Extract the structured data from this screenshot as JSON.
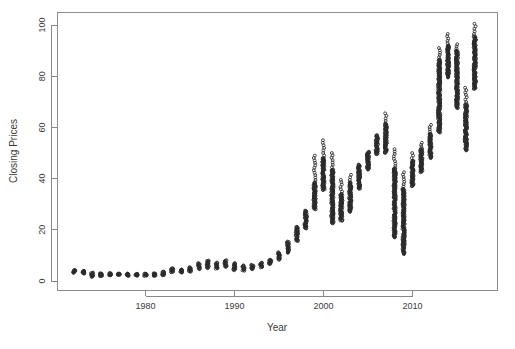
{
  "chart_data": {
    "type": "scatter",
    "title": "",
    "xlabel": "Year",
    "ylabel": "Closing Prices",
    "xlim": [
      1971.2,
      2018.6
    ],
    "ylim": [
      -1.5,
      103.5
    ],
    "grid": false,
    "legend": "none",
    "marker": "open-circle",
    "marker_color": "#2b2b2b",
    "xticks": [
      1980,
      1990,
      2000,
      2010
    ],
    "xtick_labels": [
      "1980",
      "1990",
      "2000",
      "2010"
    ],
    "yticks": [
      0,
      20,
      40,
      60,
      80,
      100
    ],
    "ytick_labels": [
      "0",
      "20",
      "40",
      "60",
      "80",
      "100"
    ],
    "series": [
      {
        "name": "Closing Prices",
        "x": [
          1972,
          1973,
          1974,
          1975,
          1976,
          1977,
          1978,
          1979,
          1980,
          1981,
          1982,
          1983,
          1984,
          1985,
          1986,
          1987,
          1988,
          1989,
          1990,
          1991,
          1992,
          1993,
          1994,
          1995,
          1996,
          1997,
          1998,
          1999,
          2000,
          2001,
          2002,
          2003,
          2004,
          2005,
          2006,
          2007,
          2008,
          2009,
          2010,
          2011,
          2012,
          2013,
          2014,
          2015,
          2016,
          2017
        ],
        "y_min": [
          3.2,
          2.9,
          1.6,
          1.9,
          2.2,
          2.4,
          2.0,
          2.1,
          2.0,
          2.0,
          2.2,
          3.4,
          3.3,
          3.6,
          4.6,
          5.0,
          4.8,
          5.5,
          4.2,
          4.0,
          4.6,
          5.3,
          6.6,
          8.3,
          11.0,
          15.6,
          20.5,
          28.0,
          35.5,
          22.5,
          23.5,
          27.0,
          36.0,
          43.5,
          49.5,
          50.0,
          17.0,
          10.5,
          37.0,
          42.5,
          48.0,
          58.0,
          79.5,
          67.5,
          51.0,
          75.0
        ],
        "y_max": [
          4.3,
          4.0,
          3.3,
          3.0,
          3.1,
          2.9,
          2.9,
          2.8,
          2.9,
          3.0,
          3.7,
          5.0,
          4.5,
          5.4,
          7.0,
          8.0,
          7.2,
          8.1,
          7.0,
          6.1,
          6.3,
          7.2,
          8.3,
          11.2,
          15.4,
          21.2,
          27.5,
          38.5,
          48.0,
          43.5,
          34.0,
          38.5,
          45.5,
          50.5,
          57.0,
          61.5,
          44.0,
          36.0,
          47.0,
          51.5,
          57.5,
          86.5,
          92.0,
          90.0,
          69.0,
          95.5
        ],
        "y_outliers_high": [
          null,
          null,
          null,
          null,
          null,
          null,
          null,
          null,
          null,
          null,
          null,
          null,
          null,
          null,
          null,
          null,
          null,
          null,
          null,
          null,
          null,
          null,
          null,
          null,
          null,
          null,
          null,
          49.0,
          55.0,
          50.0,
          39.5,
          41.5,
          null,
          null,
          null,
          65.5,
          51.5,
          42.5,
          50.0,
          54.0,
          61.0,
          91.0,
          96.5,
          92.5,
          75.5,
          100.5
        ]
      }
    ]
  },
  "labels": {
    "y_axis_title": "Closing Prices",
    "x_axis_title": "Year"
  }
}
